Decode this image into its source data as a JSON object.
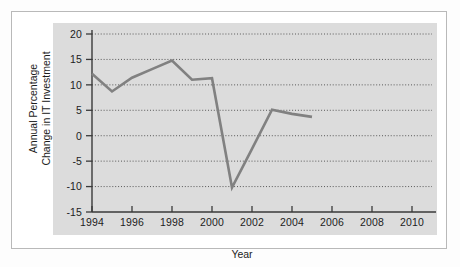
{
  "chart_data": {
    "type": "line",
    "title": "",
    "xlabel": "Year",
    "ylabel_line1": "Annual Percentage",
    "ylabel_line2": "Change in IT Investment",
    "ylabel": "Annual Percentage Change in IT Investment",
    "xlim": [
      1994,
      2011
    ],
    "ylim": [
      -15,
      20
    ],
    "xticks": [
      1994,
      1996,
      1998,
      2000,
      2002,
      2004,
      2006,
      2008,
      2010
    ],
    "xtick_labels": [
      "1994",
      "1996",
      "1998",
      "2000",
      "2002",
      "2004",
      "2006",
      "2008",
      "2010"
    ],
    "xminor_ticks": [
      1995,
      1997,
      1999,
      2001,
      2003,
      2005,
      2007,
      2009
    ],
    "yticks": [
      -15,
      -10,
      -5,
      0,
      5,
      10,
      15,
      20
    ],
    "ytick_labels": [
      "-15",
      "-10",
      "-5",
      "0",
      "5",
      "10",
      "15",
      "20"
    ],
    "grid": true,
    "grid_style": "dotted-horizontal",
    "legend": "none",
    "series": [
      {
        "name": "Annual Percentage Change in IT Investment",
        "color": "#818181",
        "x": [
          1994,
          1995,
          1996,
          1997,
          1998,
          1999,
          2000,
          2001,
          2002,
          2003,
          2004,
          2005
        ],
        "values": [
          12.2,
          8.7,
          11.4,
          13.1,
          14.8,
          11.0,
          11.3,
          -10.2,
          -2.6,
          5.1,
          4.3,
          3.7
        ]
      }
    ],
    "panel_background": "#dcdcdc",
    "card_background": "#ffffff",
    "axis_color": "#3a3a3a"
  }
}
